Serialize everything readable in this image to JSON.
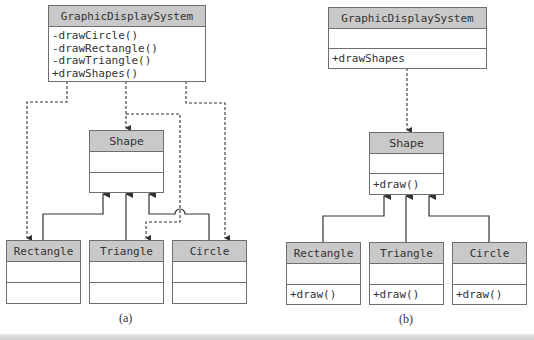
{
  "diagram_a": {
    "caption": "(a)",
    "graphic_display_system": {
      "name": "GraphicDisplaySystem",
      "operations": [
        "-drawCircle()",
        "-drawRectangle()",
        "-drawTriangle()",
        "+drawShapes()"
      ]
    },
    "shape": {
      "name": "Shape"
    },
    "rectangle": {
      "name": "Rectangle"
    },
    "triangle": {
      "name": "Triangle"
    },
    "circle": {
      "name": "Circle"
    }
  },
  "diagram_b": {
    "caption": "(b)",
    "graphic_display_system": {
      "name": "GraphicDisplaySystem",
      "operations": [
        "+drawShapes"
      ]
    },
    "shape": {
      "name": "Shape",
      "operations": [
        "+draw()"
      ]
    },
    "rectangle": {
      "name": "Rectangle",
      "operations": [
        "+draw()"
      ]
    },
    "triangle": {
      "name": "Triangle",
      "operations": [
        "+draw()"
      ]
    },
    "circle": {
      "name": "Circle",
      "operations": [
        "+draw()"
      ]
    }
  },
  "colors": {
    "header_fill": "#c9c9c9",
    "border": "#6e6e6e",
    "line": "#3a3a3a"
  }
}
